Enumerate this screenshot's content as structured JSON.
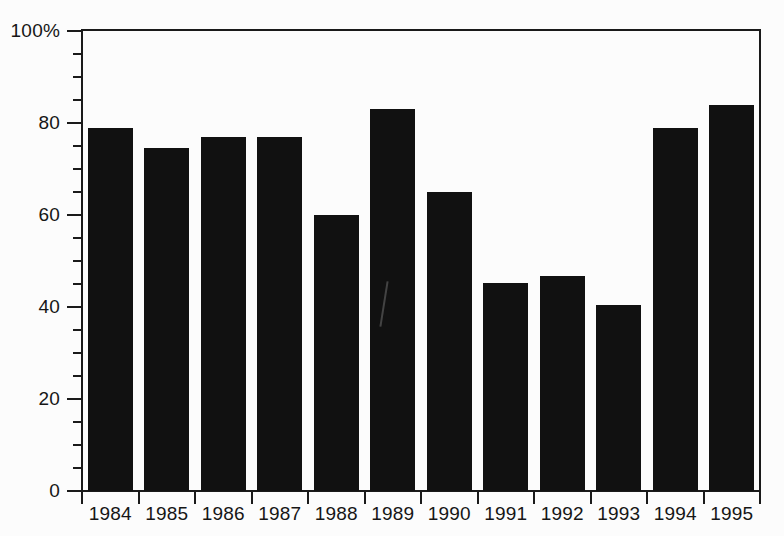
{
  "chart_data": {
    "type": "bar",
    "title": "",
    "subtitle": "",
    "xlabel": "",
    "ylabel": "",
    "categories": [
      "1984",
      "1985",
      "1986",
      "1987",
      "1988",
      "1989",
      "1990",
      "1991",
      "1992",
      "1993",
      "1994",
      "1995"
    ],
    "values": [
      78.9,
      74.6,
      77.0,
      77.0,
      60.0,
      83.0,
      65.0,
      45.2,
      46.7,
      40.5,
      79.0,
      84.0
    ],
    "ylim": [
      0,
      100
    ],
    "y_major_ticks": [
      "0",
      "20",
      "40",
      "60",
      "80",
      "100%"
    ],
    "y_major_tick_values": [
      0,
      20,
      40,
      60,
      80,
      100
    ],
    "y_minor_tick_values": [
      5,
      10,
      15,
      25,
      30,
      35,
      45,
      50,
      55,
      65,
      70,
      75,
      85,
      90,
      95
    ],
    "grid": false,
    "legend": null,
    "legend_position": "none",
    "annotations": [],
    "bar_color": "#111111",
    "axis_color": "#1a1a1a",
    "background_color": "#fcfcfc"
  }
}
